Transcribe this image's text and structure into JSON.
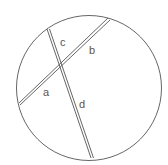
{
  "diagram": {
    "circle": {
      "cx": 89,
      "cy": 88,
      "r": 73,
      "stroke": "#666666"
    },
    "chords": [
      {
        "name": "chord-ab",
        "x1": 19,
        "y1": 104,
        "x2": 109,
        "y2": 19
      },
      {
        "name": "chord-cd",
        "x1": 48,
        "y1": 29,
        "x2": 92,
        "y2": 158
      }
    ],
    "labels": {
      "a": "a",
      "b": "b",
      "c": "c",
      "d": "d"
    },
    "line_color": "#555555"
  }
}
